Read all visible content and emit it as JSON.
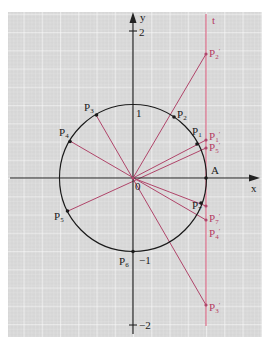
{
  "diagram": {
    "type": "unit circle with tangent line projections",
    "axes": {
      "x_label": "x",
      "y_label": "y",
      "origin_label": "0",
      "y_ticks": [
        {
          "value": 2,
          "label": "2"
        },
        {
          "value": 1,
          "label": "1"
        },
        {
          "value": -1,
          "label": "−1"
        },
        {
          "value": -2,
          "label": "−2"
        }
      ]
    },
    "tangent_line": {
      "label": "t",
      "x": 1
    },
    "circle": {
      "radius": 1,
      "center": [
        0,
        0
      ]
    },
    "point_A": {
      "label": "A",
      "x": 1,
      "y": 0
    },
    "circle_points": [
      {
        "label": "P",
        "sub": "1",
        "angle_deg": 27
      },
      {
        "label": "P",
        "sub": "2",
        "angle_deg": 55
      },
      {
        "label": "P",
        "sub": "3",
        "angle_deg": 120
      },
      {
        "label": "P",
        "sub": "4",
        "angle_deg": 150
      },
      {
        "label": "P",
        "sub": "5",
        "angle_deg": 207
      },
      {
        "label": "P",
        "sub": "6",
        "angle_deg": 270
      },
      {
        "label": "P",
        "sub": "7",
        "angle_deg": -20
      }
    ],
    "tangent_points": [
      {
        "label": "P",
        "sub": "2",
        "prime": "′",
        "y": 1.7
      },
      {
        "label": "P",
        "sub": "1",
        "prime": "′",
        "y": 0.51
      },
      {
        "label": "P",
        "sub": "5",
        "prime": "′",
        "y": 0.41
      },
      {
        "label": "P",
        "sub": "7",
        "prime": "′",
        "y": -0.36
      },
      {
        "label": "P",
        "sub": "4",
        "prime": "′",
        "y": -0.58
      },
      {
        "label": "P",
        "sub": "3",
        "prime": "′",
        "y": -1.73
      }
    ],
    "colors": {
      "grid_bg": "#d9d9d9",
      "grid_line": "#f4f4f4",
      "axis": "#222222",
      "circle": "#1a1a1a",
      "ray": "#b0456a",
      "tangent": "#d9607f",
      "label_black": "#1a1a1a",
      "label_pink": "#b43a62"
    }
  }
}
